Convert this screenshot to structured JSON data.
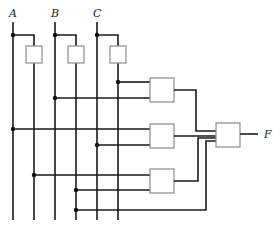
{
  "diagram": {
    "type": "logic-circuit",
    "inputs": [
      {
        "name": "A",
        "x": 13,
        "label_x": 10
      },
      {
        "name": "B",
        "x": 55,
        "label_x": 52
      },
      {
        "name": "C",
        "x": 97,
        "label_x": 94
      }
    ],
    "inverters": [
      {
        "input": "A",
        "output_x": 34
      },
      {
        "input": "B",
        "output_x": 76
      },
      {
        "input": "C",
        "output_x": 118
      }
    ],
    "and_gates": [
      {
        "id": "g1",
        "inputs": [
          "C'",
          "B"
        ]
      },
      {
        "id": "g2",
        "inputs": [
          "A",
          "C"
        ]
      },
      {
        "id": "g3",
        "inputs": [
          "A'",
          "B'"
        ]
      }
    ],
    "or_gate": {
      "inputs": [
        "g1",
        "g2",
        "g3",
        "C"
      ]
    },
    "output": {
      "name": "F"
    }
  }
}
